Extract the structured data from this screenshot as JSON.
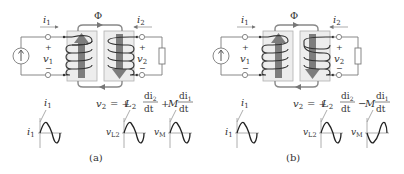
{
  "figures": [
    {
      "id": "a",
      "caption": "(a)",
      "current_in_label": "i",
      "current_in_sub": "1",
      "current_out_label": "i",
      "current_out_sub": "2",
      "flux_label": "Φ",
      "v1_plus": "+",
      "v1_label": "v",
      "v1_sub": "1",
      "v1_minus": "−",
      "v2_plus": "+",
      "v2_label": "v",
      "v2_sub": "2",
      "v2_minus": "−",
      "primary_flux_arrow": "up",
      "secondary_flux_arrow": "down",
      "equation": {
        "lhs": "v",
        "lhs_sub": "2",
        "eq": "= +",
        "L": "L",
        "L_sub": "2",
        "d_num1": "di",
        "d_num1_sub": "2",
        "d_den1": "dt",
        "sign2": "+",
        "M": "M",
        "d_num2": "di",
        "d_num2_sub": "1",
        "d_den2": "dt"
      },
      "waves": [
        {
          "top_label": "i",
          "top_sub": "1",
          "side_label": "i",
          "side_sub": "1",
          "phase": "sine"
        },
        {
          "side_label": "v",
          "side_sub": "L2",
          "phase": "sine"
        },
        {
          "side_label": "v",
          "side_sub": "M",
          "phase": "sine"
        }
      ]
    },
    {
      "id": "b",
      "caption": "(b)",
      "current_in_label": "i",
      "current_in_sub": "1",
      "current_out_label": "i",
      "current_out_sub": "2",
      "flux_label": "Φ",
      "v1_plus": "+",
      "v1_label": "v",
      "v1_sub": "1",
      "v1_minus": "−",
      "v2_plus": "+",
      "v2_label": "v",
      "v2_sub": "2",
      "v2_minus": "−",
      "primary_flux_arrow": "up",
      "secondary_flux_arrow": "down",
      "equation": {
        "lhs": "v",
        "lhs_sub": "2",
        "eq": "= +",
        "L": "L",
        "L_sub": "2",
        "d_num1": "di",
        "d_num1_sub": "2",
        "d_den1": "dt",
        "sign2": "−",
        "M": "M",
        "d_num2": "di",
        "d_num2_sub": "1",
        "d_den2": "dt"
      },
      "waves": [
        {
          "top_label": "i",
          "top_sub": "1",
          "side_label": "i",
          "side_sub": "1",
          "phase": "sine"
        },
        {
          "side_label": "v",
          "side_sub": "L2",
          "phase": "sine"
        },
        {
          "side_label": "v",
          "side_sub": "M",
          "phase": "inverted-sine"
        }
      ]
    }
  ],
  "colors": {
    "flux_arrow": "#7d7d7d",
    "core": "#ededed",
    "wire": "#7a7a7a",
    "text": "#333333"
  }
}
